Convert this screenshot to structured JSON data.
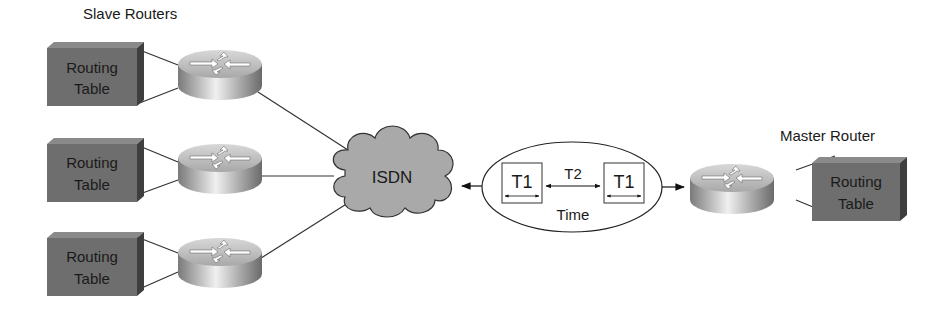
{
  "labels": {
    "slave_routers": "Slave Routers",
    "master_router": "Master Router",
    "cloud": "ISDN",
    "time": "Time",
    "t1_left": "T1",
    "t2": "T2",
    "t1_right": "T1"
  },
  "routing_tables": [
    {
      "line1": "Routing",
      "line2": "Table"
    },
    {
      "line1": "Routing",
      "line2": "Table"
    },
    {
      "line1": "Routing",
      "line2": "Table"
    },
    {
      "line1": "Routing",
      "line2": "Table"
    }
  ],
  "colors": {
    "table_fill": "#6e6e6e",
    "cloud_fill": "#a9a9a9",
    "router_fill": "#bdbdbd"
  }
}
